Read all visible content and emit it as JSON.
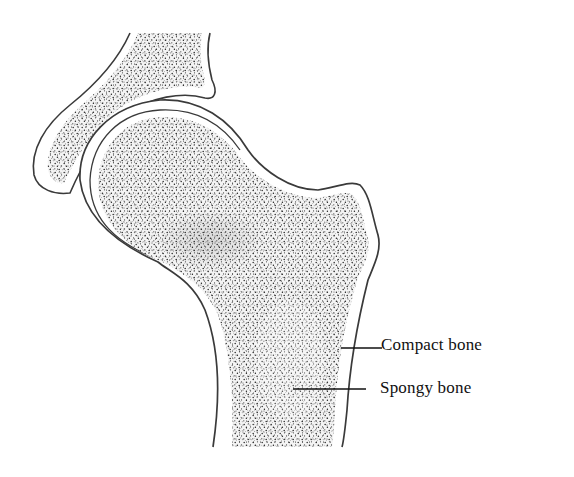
{
  "diagram": {
    "colors": {
      "outline": "#3a3a3a",
      "stipple": "#2a2a2a",
      "background": "#ffffff"
    },
    "labels": [
      {
        "id": "compact",
        "text": "Compact bone",
        "leader_from": [
          341,
          348
        ],
        "leader_to": [
          382,
          348
        ]
      },
      {
        "id": "spongy",
        "text": "Spongy bone",
        "leader_from": [
          293,
          389
        ],
        "leader_to": [
          366,
          389
        ]
      }
    ]
  }
}
